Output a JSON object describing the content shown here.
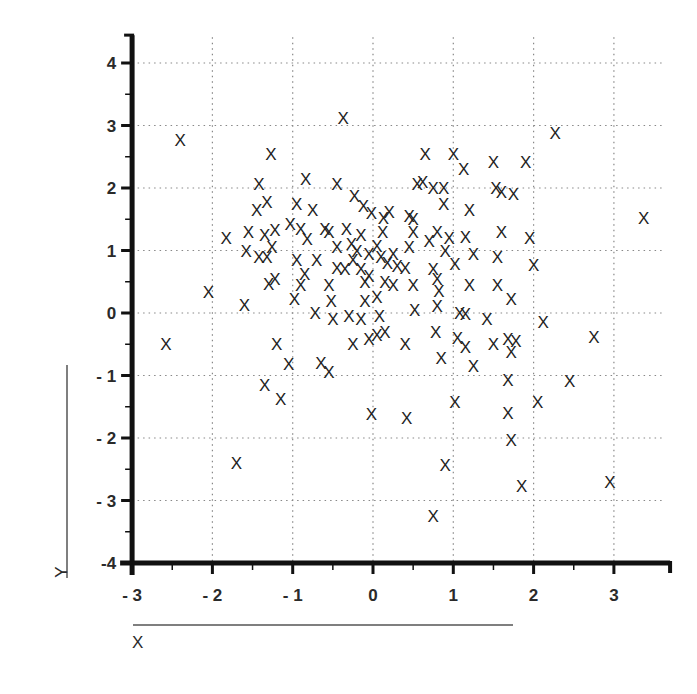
{
  "chart_data": {
    "type": "scatter",
    "title": "",
    "xlabel": "X",
    "ylabel": "Y",
    "marker": "X",
    "xlim": [
      -3,
      3.6
    ],
    "ylim": [
      -4,
      4.35
    ],
    "grid": true,
    "grid_style": "dotted",
    "legend": null,
    "x_ticks": [
      -3,
      -2,
      -1,
      0,
      1,
      2,
      3
    ],
    "x_tick_labels": [
      "- 3",
      "- 2",
      "- 1",
      "0",
      "1",
      "2",
      "3"
    ],
    "y_ticks": [
      4,
      3,
      2,
      1,
      0,
      -1,
      -2,
      -3,
      -4
    ],
    "y_tick_labels": [
      "4",
      "3",
      "2",
      "1",
      "0",
      "- 1",
      "- 2",
      "- 3",
      "-4"
    ],
    "points": [
      [
        -2.4,
        2.77
      ],
      [
        -0.37,
        3.12
      ],
      [
        2.27,
        2.88
      ],
      [
        3.37,
        1.52
      ],
      [
        -1.27,
        2.55
      ],
      [
        -0.84,
        2.15
      ],
      [
        -0.45,
        2.07
      ],
      [
        -1.42,
        2.07
      ],
      [
        -1.32,
        1.77
      ],
      [
        -0.95,
        1.75
      ],
      [
        -0.75,
        1.65
      ],
      [
        -0.23,
        1.88
      ],
      [
        -0.12,
        1.72
      ],
      [
        -0.02,
        1.6
      ],
      [
        0.13,
        1.52
      ],
      [
        0.2,
        1.62
      ],
      [
        -1.45,
        1.65
      ],
      [
        -1.22,
        1.33
      ],
      [
        -1.55,
        1.3
      ],
      [
        -1.35,
        1.25
      ],
      [
        -1.83,
        1.2
      ],
      [
        -1.58,
        1.0
      ],
      [
        -1.42,
        0.9
      ],
      [
        -1.26,
        1.05
      ],
      [
        -1.32,
        0.9
      ],
      [
        -1.22,
        0.55
      ],
      [
        -1.3,
        0.47
      ],
      [
        -1.03,
        1.42
      ],
      [
        -0.9,
        1.35
      ],
      [
        -0.6,
        1.35
      ],
      [
        -0.82,
        1.18
      ],
      [
        -0.55,
        1.3
      ],
      [
        -0.33,
        1.35
      ],
      [
        -0.27,
        1.1
      ],
      [
        -0.2,
        1.0
      ],
      [
        -0.15,
        1.25
      ],
      [
        -0.45,
        1.05
      ],
      [
        -0.7,
        0.85
      ],
      [
        -0.95,
        0.85
      ],
      [
        -0.85,
        0.62
      ],
      [
        -0.9,
        0.45
      ],
      [
        -0.98,
        0.22
      ],
      [
        -0.72,
        0.0
      ],
      [
        -0.55,
        0.45
      ],
      [
        -0.45,
        0.72
      ],
      [
        -0.35,
        0.7
      ],
      [
        -0.25,
        0.85
      ],
      [
        -0.15,
        0.7
      ],
      [
        -0.1,
        0.5
      ],
      [
        -0.52,
        0.2
      ],
      [
        -0.5,
        -0.1
      ],
      [
        -0.3,
        -0.05
      ],
      [
        -0.15,
        -0.1
      ],
      [
        -0.25,
        -0.5
      ],
      [
        -0.65,
        -0.8
      ],
      [
        -0.55,
        -0.95
      ],
      [
        -1.35,
        -1.15
      ],
      [
        -1.2,
        -0.5
      ],
      [
        -1.05,
        -0.82
      ],
      [
        -1.15,
        -1.38
      ],
      [
        -2.05,
        0.33
      ],
      [
        -1.6,
        0.13
      ],
      [
        -2.58,
        -0.5
      ],
      [
        -1.7,
        -2.4
      ],
      [
        0.05,
        1.08
      ],
      [
        0.1,
        0.9
      ],
      [
        0.18,
        0.8
      ],
      [
        0.25,
        0.95
      ],
      [
        0.3,
        0.75
      ],
      [
        0.4,
        0.72
      ],
      [
        0.45,
        1.05
      ],
      [
        0.5,
        1.3
      ],
      [
        0.5,
        1.5
      ],
      [
        0.45,
        1.55
      ],
      [
        0.55,
        2.07
      ],
      [
        0.62,
        2.1
      ],
      [
        0.65,
        2.55
      ],
      [
        0.75,
        2.0
      ],
      [
        0.88,
        2.0
      ],
      [
        0.88,
        1.75
      ],
      [
        1.0,
        2.55
      ],
      [
        1.13,
        2.3
      ],
      [
        1.5,
        2.42
      ],
      [
        1.9,
        2.42
      ],
      [
        1.53,
        2.0
      ],
      [
        1.6,
        1.93
      ],
      [
        1.75,
        1.9
      ],
      [
        1.2,
        1.65
      ],
      [
        1.6,
        1.3
      ],
      [
        1.95,
        1.2
      ],
      [
        2.0,
        0.77
      ],
      [
        1.15,
        1.22
      ],
      [
        0.95,
        1.2
      ],
      [
        0.8,
        1.3
      ],
      [
        0.7,
        1.15
      ],
      [
        0.9,
        1.0
      ],
      [
        1.02,
        0.78
      ],
      [
        1.25,
        0.95
      ],
      [
        1.55,
        0.9
      ],
      [
        1.2,
        0.45
      ],
      [
        1.55,
        0.45
      ],
      [
        1.72,
        0.22
      ],
      [
        0.75,
        0.7
      ],
      [
        0.8,
        0.55
      ],
      [
        0.82,
        0.35
      ],
      [
        0.8,
        0.12
      ],
      [
        0.5,
        0.45
      ],
      [
        0.52,
        0.05
      ],
      [
        0.15,
        0.5
      ],
      [
        0.25,
        0.45
      ],
      [
        0.05,
        0.25
      ],
      [
        0.08,
        -0.05
      ],
      [
        0.15,
        -0.3
      ],
      [
        -0.05,
        -0.42
      ],
      [
        0.05,
        -0.35
      ],
      [
        0.4,
        -0.5
      ],
      [
        0.78,
        -0.3
      ],
      [
        0.85,
        -0.72
      ],
      [
        1.08,
        0.0
      ],
      [
        1.15,
        -0.02
      ],
      [
        1.05,
        -0.4
      ],
      [
        1.15,
        -0.55
      ],
      [
        1.25,
        -0.85
      ],
      [
        1.42,
        -0.1
      ],
      [
        1.5,
        -0.5
      ],
      [
        1.68,
        -0.42
      ],
      [
        1.72,
        -0.62
      ],
      [
        1.78,
        -0.45
      ],
      [
        2.12,
        -0.15
      ],
      [
        2.75,
        -0.38
      ],
      [
        2.45,
        -1.08
      ],
      [
        2.05,
        -1.42
      ],
      [
        1.68,
        -1.07
      ],
      [
        1.68,
        -1.6
      ],
      [
        1.72,
        -2.03
      ],
      [
        1.85,
        -2.77
      ],
      [
        2.95,
        -2.7
      ],
      [
        1.02,
        -1.42
      ],
      [
        0.9,
        -2.43
      ],
      [
        0.75,
        -3.25
      ],
      [
        0.42,
        -1.68
      ],
      [
        -0.02,
        -1.62
      ],
      [
        -0.05,
        0.6
      ],
      [
        0.12,
        1.3
      ],
      [
        -0.05,
        0.95
      ],
      [
        -0.1,
        0.2
      ]
    ]
  },
  "axes": {
    "x_title": "X",
    "y_title": "Y"
  }
}
